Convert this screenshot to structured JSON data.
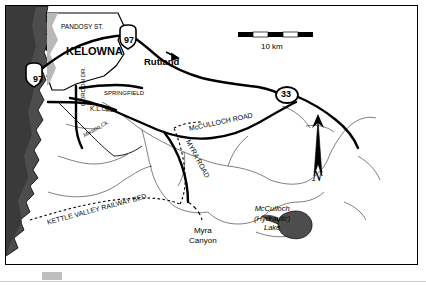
{
  "map": {
    "title_hidden": "",
    "scale_bar": {
      "label": "10 km",
      "segments": 4
    },
    "compass": {
      "letter": "N"
    },
    "labels": [
      {
        "id": "pandosy-st",
        "text": "PANDOSY ST.",
        "x": 55,
        "y": 17,
        "size": 6.5,
        "bold": false,
        "italic": false,
        "rotate": 0
      },
      {
        "id": "kelowna",
        "text": "KELOWNA",
        "x": 60,
        "y": 39,
        "size": 11,
        "bold": true,
        "italic": false,
        "rotate": 0
      },
      {
        "id": "rutland",
        "text": "Rutland",
        "x": 138,
        "y": 50,
        "size": 9.5,
        "bold": true,
        "italic": false,
        "rotate": 0
      },
      {
        "id": "springfield",
        "text": "SPRINGFIELD",
        "x": 98,
        "y": 83,
        "size": 6,
        "bold": false,
        "italic": false,
        "rotate": 0
      },
      {
        "id": "klo",
        "text": "K.L.O.",
        "x": 84,
        "y": 99,
        "size": 6.5,
        "bold": false,
        "italic": false,
        "rotate": 0
      },
      {
        "id": "rd-1",
        "text": "RD.",
        "x": 100,
        "y": 101,
        "size": 5.5,
        "bold": false,
        "italic": false,
        "rotate": 0
      },
      {
        "id": "gordon-dr",
        "text": "GORDON DR.",
        "x": 73,
        "y": 100,
        "size": 6,
        "bold": false,
        "italic": false,
        "rotate": -90
      },
      {
        "id": "mission-ck",
        "text": "Mission Ck.",
        "x": 76,
        "y": 127,
        "size": 5.5,
        "bold": false,
        "italic": true,
        "rotate": -30
      },
      {
        "id": "mcculloch-road",
        "text": "McCULLOCH ROAD",
        "x": 182,
        "y": 118,
        "size": 7,
        "bold": false,
        "italic": false,
        "rotate": -12
      },
      {
        "id": "myra-road",
        "text": "MYRA   ROAD",
        "x": 186,
        "y": 132,
        "size": 7,
        "bold": false,
        "italic": false,
        "rotate": 62
      },
      {
        "id": "kettle-valley",
        "text": "KETTLE VALLEY  RAILWAY  BED",
        "x": 40,
        "y": 212,
        "size": 7,
        "bold": false,
        "italic": false,
        "rotate": -15
      },
      {
        "id": "myra-canyon",
        "text": "Myra\nCanyon",
        "x": 183,
        "y": 220,
        "size": 8,
        "bold": false,
        "italic": false,
        "rotate": 0
      },
      {
        "id": "mcculloch-lake",
        "text": "McCulloch\n(Hydraulic)\nLake",
        "x": 248,
        "y": 198,
        "size": 7.5,
        "bold": false,
        "italic": true,
        "rotate": 0
      }
    ],
    "highway_shields": [
      {
        "id": "hwy-97-north",
        "text": "97",
        "x": 123,
        "y": 35,
        "shape": "shield"
      },
      {
        "id": "hwy-97-west",
        "text": "97",
        "x": 32,
        "y": 74,
        "shape": "shield"
      },
      {
        "id": "hwy-33",
        "text": "33",
        "x": 280,
        "y": 89,
        "shape": "oval"
      }
    ]
  }
}
